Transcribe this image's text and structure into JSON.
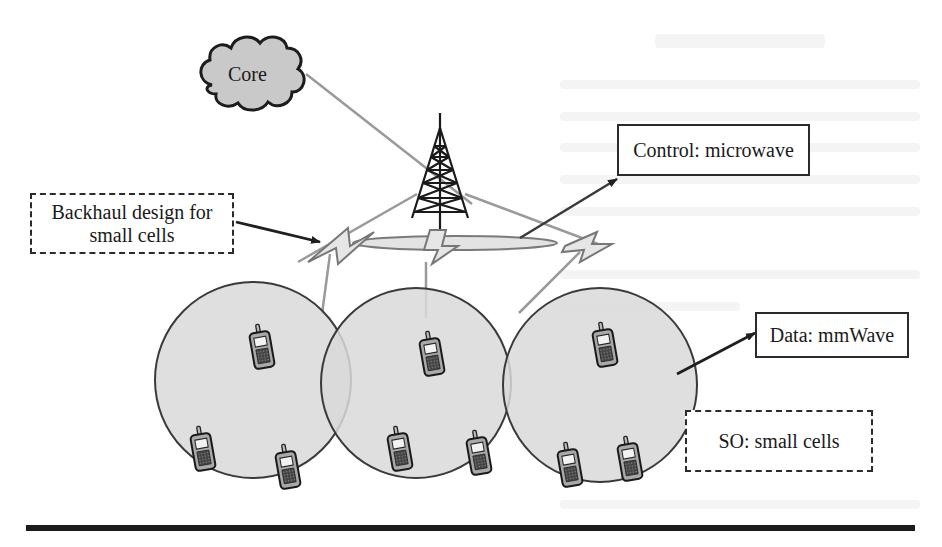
{
  "figure": {
    "core": {
      "label": "Core",
      "icon": "cloud-icon"
    },
    "tower": {
      "icon": "cell-tower-icon"
    },
    "labels": {
      "control": "Control: microwave",
      "backhaul_line1": "Backhaul design for",
      "backhaul_line2": "small cells",
      "data": "Data: mmWave",
      "so": "SO: small cells"
    },
    "cells": [
      {
        "name": "small-cell-left",
        "phones": 3
      },
      {
        "name": "small-cell-middle",
        "phones": 3
      },
      {
        "name": "small-cell-right",
        "phones": 3
      }
    ],
    "colors": {
      "cell_fill": "#d9d9d9",
      "cell_stroke": "#3a3a3a",
      "link_gray": "#9a9a9a",
      "bolt_fill": "#e6e6e6",
      "box_border": "#2b2b2b",
      "text": "#1a1a1a"
    }
  }
}
